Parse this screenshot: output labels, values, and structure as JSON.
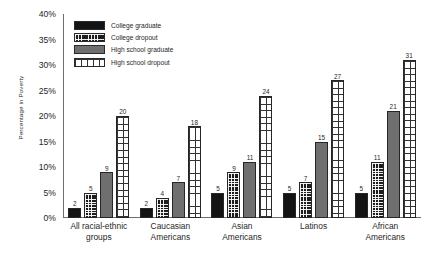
{
  "chart_data": {
    "type": "bar",
    "title": "",
    "xlabel": "",
    "ylabel": "Percentage in Poverty",
    "ylim": [
      0,
      40
    ],
    "ytick_labels": [
      "40%",
      "35%",
      "30%",
      "25%",
      "20%",
      "15%",
      "10%",
      "5%",
      "0%"
    ],
    "ytick_values": [
      40,
      35,
      30,
      25,
      20,
      15,
      10,
      5,
      0
    ],
    "grid": false,
    "legend_position": "top-left",
    "categories": [
      "All racial-ethnic\ngroups",
      "Caucasian\nAmericans",
      "Asian\nAmericans",
      "Latinos",
      "African\nAmericans"
    ],
    "series": [
      {
        "name": "College graduate",
        "pattern": "solid-black",
        "color": "#141414",
        "values": [
          2,
          2,
          5,
          5,
          5
        ]
      },
      {
        "name": "College dropout",
        "pattern": "dense-grid",
        "color": "#1d1d1d",
        "values": [
          5,
          4,
          9,
          7,
          11
        ]
      },
      {
        "name": "High school graduate",
        "pattern": "solid-gray",
        "color": "#6f6f6f",
        "values": [
          9,
          7,
          11,
          15,
          21
        ]
      },
      {
        "name": "High school dropout",
        "pattern": "open-grid",
        "color": "#ffffff",
        "values": [
          20,
          18,
          24,
          27,
          31
        ]
      }
    ]
  }
}
